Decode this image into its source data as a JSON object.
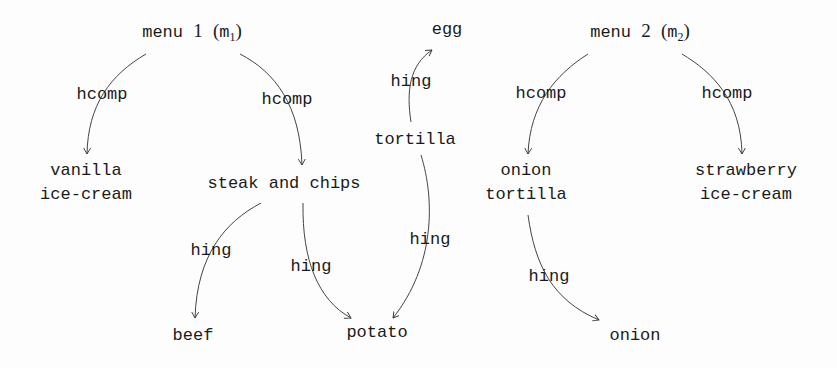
{
  "nodes": {
    "menu1": {
      "label": "menu",
      "num": "1",
      "abbr": "m",
      "sub": "1"
    },
    "menu2": {
      "label": "menu",
      "num": "2",
      "abbr": "m",
      "sub": "2"
    },
    "vanilla": {
      "line1": "vanilla",
      "line2": "ice-cream"
    },
    "steak": "steak and chips",
    "tortilla_center": "tortilla",
    "egg": "egg",
    "beef": "beef",
    "potato": "potato",
    "onion_tortilla": {
      "line1": "onion",
      "line2": "tortilla"
    },
    "strawberry": {
      "line1": "strawberry",
      "line2": "ice-cream"
    },
    "onion": "onion"
  },
  "edges": [
    {
      "from": "menu1",
      "to": "vanilla",
      "label": "hcomp"
    },
    {
      "from": "menu1",
      "to": "steak",
      "label": "hcomp"
    },
    {
      "from": "steak",
      "to": "beef",
      "label": "hing"
    },
    {
      "from": "steak",
      "to": "potato",
      "label": "hing"
    },
    {
      "from": "tortilla_center",
      "to": "egg",
      "label": "hing"
    },
    {
      "from": "tortilla_center",
      "to": "potato",
      "label": "hing"
    },
    {
      "from": "menu2",
      "to": "onion_tortilla",
      "label": "hcomp"
    },
    {
      "from": "menu2",
      "to": "strawberry",
      "label": "hcomp"
    },
    {
      "from": "onion_tortilla",
      "to": "onion",
      "label": "hing"
    }
  ]
}
